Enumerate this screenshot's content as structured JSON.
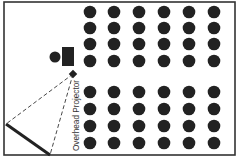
{
  "diagram": {
    "colors": {
      "ink": "#222222",
      "background": "#ffffff",
      "border": "#333333"
    },
    "room": {
      "x": 4,
      "y": 2,
      "w": 231,
      "h": 153
    },
    "seat_columns_x": [
      90,
      114,
      139,
      164,
      189,
      214
    ],
    "seat_rows_y": [
      12,
      28,
      44,
      61,
      92,
      109,
      126,
      143
    ],
    "seat_radius": 6.3,
    "presenter": {
      "person": {
        "cx": 55,
        "cy": 57,
        "r": 5.5
      },
      "desk": {
        "x": 62,
        "y": 47,
        "w": 12,
        "h": 19
      }
    },
    "projector": {
      "cx": 73,
      "cy": 74,
      "size": 6,
      "label": "Overhead Projector"
    },
    "screen": {
      "x1": 6,
      "y1": 124,
      "x2": 50,
      "y2": 155
    }
  }
}
